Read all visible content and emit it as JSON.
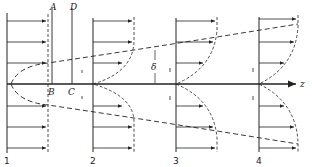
{
  "diagram": {
    "labels": {
      "A": "A",
      "B": "B",
      "C": "C",
      "D": "D",
      "delta": "δ",
      "z": "z",
      "station_1": "1",
      "station_2": "2",
      "station_3": "3",
      "station_4": "4"
    },
    "stations": [
      {
        "id": "1",
        "x": 7
      },
      {
        "id": "2",
        "x": 93
      },
      {
        "id": "3",
        "x": 176
      },
      {
        "id": "4",
        "x": 259
      }
    ],
    "colors": {
      "ink": "#222222",
      "background": "#ffffff"
    }
  }
}
